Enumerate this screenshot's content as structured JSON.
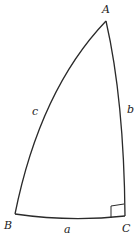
{
  "diagram": {
    "type": "spherical-right-triangle",
    "vertices": {
      "A": {
        "label": "A",
        "x": 106,
        "y": 21
      },
      "B": {
        "label": "B",
        "x": 15,
        "y": 214
      },
      "C": {
        "label": "C",
        "x": 125,
        "y": 216
      }
    },
    "sides": {
      "a": {
        "label": "a",
        "between": [
          "B",
          "C"
        ]
      },
      "b": {
        "label": "b",
        "between": [
          "A",
          "C"
        ]
      },
      "c": {
        "label": "c",
        "between": [
          "A",
          "B"
        ]
      }
    },
    "right_angle_at": "C",
    "stroke_color": "#2a2a2a"
  }
}
